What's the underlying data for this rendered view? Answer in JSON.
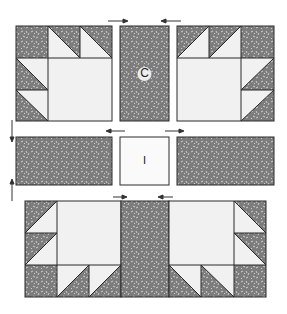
{
  "diagram": {
    "type": "quilt-block-assembly",
    "colors": {
      "print": "#7c7c7c",
      "speck": "#d8d8d8",
      "light": "#f1f1f1",
      "line": "#2a2a2a",
      "arrow": "#333333"
    },
    "labels": {
      "center_strip": "C",
      "center_square": "I"
    },
    "rows": [
      {
        "name": "top-row",
        "units": [
          "bear-paw-block-left",
          "sashing-strip-C",
          "bear-paw-block-right"
        ]
      },
      {
        "name": "middle-row",
        "units": [
          "sashing-strip",
          "center-square-I",
          "sashing-strip"
        ]
      },
      {
        "name": "bottom-row",
        "units": [
          "bear-paw-block-left",
          "sashing-strip",
          "bear-paw-block-right"
        ]
      }
    ],
    "pressing_arrows": [
      {
        "row": "top",
        "direction": "right",
        "position": "left"
      },
      {
        "row": "top",
        "direction": "left",
        "position": "right"
      },
      {
        "row": "middle",
        "direction": "left",
        "position": "left"
      },
      {
        "row": "middle",
        "direction": "right",
        "position": "right"
      },
      {
        "row": "bottom",
        "direction": "right",
        "position": "left"
      },
      {
        "row": "bottom",
        "direction": "left",
        "position": "right"
      },
      {
        "row": "side",
        "direction": "down",
        "position": "upper"
      },
      {
        "row": "side",
        "direction": "up",
        "position": "lower"
      }
    ]
  }
}
